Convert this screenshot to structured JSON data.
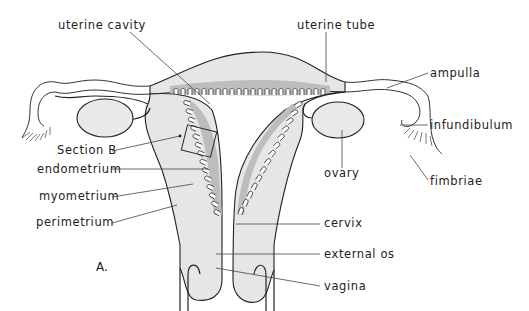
{
  "figure": {
    "panel_label": "A.",
    "colors": {
      "background": "#ffffff",
      "tissue": "#e6e6e6",
      "endometrium": "#bdbdbd",
      "line": "#222222",
      "text": "#222222"
    },
    "labels": {
      "uterine_cavity": "uterine cavity",
      "uterine_tube": "uterine tube",
      "ampulla": "ampulla",
      "infundibulum": "infundibulum",
      "section_b": "Section B",
      "endometrium": "endometrium",
      "myometrium": "myometrium",
      "perimetrium": "perimetrium",
      "ovary": "ovary",
      "fimbriae": "fimbriae",
      "cervix": "cervix",
      "external_os": "external os",
      "vagina": "vagina"
    }
  }
}
